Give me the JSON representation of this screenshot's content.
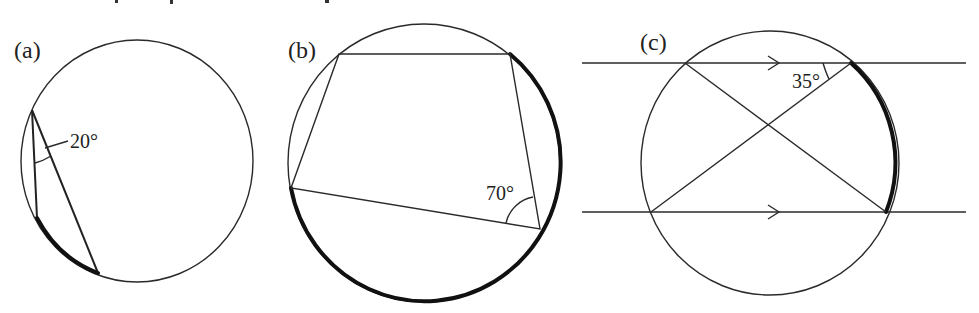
{
  "figures": [
    {
      "id": "a",
      "label": "(a)",
      "angle_label": "20°",
      "circle": {
        "cx": 137,
        "cy": 161,
        "r": 118
      },
      "vertex": [
        32,
        110
      ],
      "chord_ends": [
        [
          37,
          218
        ],
        [
          98,
          273
        ]
      ],
      "highlighted_arc": "arc between chord ends (37,218) and (98,273)"
    },
    {
      "id": "b",
      "label": "(b)",
      "angle_label": "70°",
      "circle": {
        "cx": 424,
        "cy": 163,
        "r": 137
      },
      "quadrilateral": [
        [
          339,
          54
        ],
        [
          510,
          54
        ],
        [
          540,
          229
        ],
        [
          291,
          188
        ]
      ],
      "highlighted_arc": "major arc from (510,54) clockwise to (291,188)"
    },
    {
      "id": "c",
      "label": "(c)",
      "angle_label": "35°",
      "circle": {
        "cx": 770,
        "cy": 163,
        "r": 131
      },
      "parallel_lines_y": [
        63,
        212
      ],
      "chord_points": [
        [
          685,
          63
        ],
        [
          851,
          63
        ],
        [
          651,
          212
        ],
        [
          886,
          212
        ]
      ],
      "highlighted_arc": "arc from (851,63) to (886,212)"
    }
  ]
}
